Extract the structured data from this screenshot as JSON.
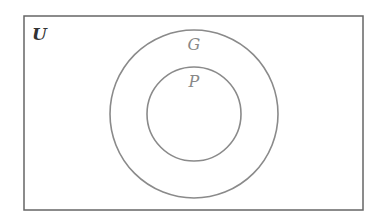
{
  "diagram": {
    "type": "venn",
    "universe": {
      "label": "U",
      "x": 24,
      "y": 16,
      "width": 339,
      "height": 194
    },
    "sets": [
      {
        "label": "G",
        "cx": 194,
        "cy": 114,
        "r": 84,
        "label_x": 194,
        "label_y": 50
      },
      {
        "label": "P",
        "cx": 194,
        "cy": 114,
        "r": 47,
        "label_x": 194,
        "label_y": 87
      }
    ],
    "relation": "P is a subset of G, G is a subset of U",
    "colors": {
      "stroke": "#8a8a8a",
      "border": "#555555",
      "text_universe": "#333333",
      "text_set": "#888888"
    }
  }
}
